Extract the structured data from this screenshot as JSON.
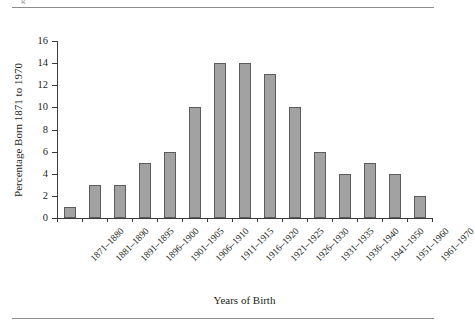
{
  "chart_data": {
    "type": "bar",
    "title": "",
    "xlabel": "Years of Birth",
    "ylabel": "Percentage Born 1871 to 1970",
    "ylim": [
      0,
      16
    ],
    "ytick_step": 2,
    "yticks": [
      "16",
      "14",
      "12",
      "10",
      "8",
      "6",
      "4",
      "2",
      "0"
    ],
    "grid": false,
    "legend": "none",
    "bar_fill_color": "#a2a2a2",
    "bar_edge_color": "#5c5c5c",
    "axis_color": "#3a3a3a",
    "categories": [
      "1871–1880",
      "1881–1890",
      "1891–1895",
      "1896–1900",
      "1901–1905",
      "1906–1910",
      "1911–1915",
      "1916–1920",
      "1921–1925",
      "1926–1930",
      "1931–1935",
      "1936–1940",
      "1941–1950",
      "1951–1960",
      "1961–1970"
    ],
    "values": [
      1,
      3,
      3,
      5,
      6,
      10,
      14,
      14,
      13,
      10,
      6,
      4,
      5,
      4,
      2
    ]
  },
  "page": {
    "top_rule": true,
    "bottom_rule": true,
    "clipped_fragment": "g"
  }
}
